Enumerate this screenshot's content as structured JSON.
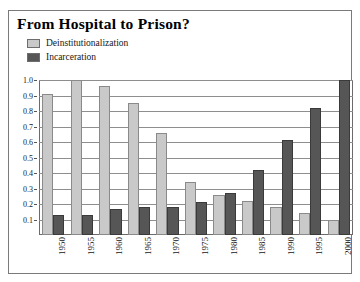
{
  "figure": {
    "title": "From Hospital to Prison?"
  },
  "legend": {
    "position": "top-left",
    "items": [
      {
        "label": "Deinstitutionalization",
        "color": "#c9c9c9",
        "swatch_name": "legend-swatch-deinstitutionalization"
      },
      {
        "label": "Incarceration",
        "color": "#565656",
        "swatch_name": "legend-swatch-incarceration"
      }
    ]
  },
  "chart_data": {
    "type": "bar",
    "title": "From Hospital to Prison?",
    "xlabel": "",
    "ylabel": "",
    "ylim": [
      0,
      1.0
    ],
    "grid": true,
    "legend_position": "top-left",
    "categories": [
      "1950",
      "1955",
      "1960",
      "1965",
      "1970",
      "1975",
      "1980",
      "1985",
      "1990",
      "1995",
      "2000"
    ],
    "ytick_labels": [
      "0.1",
      "0.2",
      "0.3",
      "0.4",
      "0.5",
      "0.6",
      "0.7",
      "0.8",
      "0.9",
      "1.0"
    ],
    "ytick_values": [
      0.1,
      0.2,
      0.3,
      0.4,
      0.5,
      0.6,
      0.7,
      0.8,
      0.9,
      1.0
    ],
    "series": [
      {
        "name": "Deinstitutionalization",
        "color": "#c9c9c9",
        "values": [
          0.91,
          1.0,
          0.96,
          0.85,
          0.66,
          0.34,
          0.26,
          0.22,
          0.18,
          0.14,
          0.1
        ]
      },
      {
        "name": "Incarceration",
        "color": "#565656",
        "values": [
          0.13,
          0.13,
          0.17,
          0.18,
          0.18,
          0.21,
          0.27,
          0.42,
          0.61,
          0.82,
          1.0
        ]
      }
    ]
  }
}
